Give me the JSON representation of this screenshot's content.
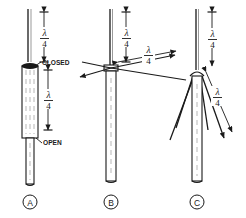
{
  "figure": {
    "name": "quarter-wave-vertical-antenna-variants",
    "background_color": "#ffffff",
    "line_color": "#1a1a1a",
    "width": 246,
    "height": 218
  },
  "symbols": {
    "lambda": "λ",
    "denominator": "4",
    "fraction_label": "λ/4"
  },
  "panels": [
    {
      "id": "A",
      "caption": "A",
      "title": "sleeve-coaxial-dipole",
      "labels": [
        {
          "name": "closed-label",
          "text": "CLOSED"
        },
        {
          "name": "open-label",
          "text": "OPEN"
        }
      ],
      "dimensions": [
        {
          "name": "upper-radiator-length",
          "numerator": "λ",
          "denominator": "4"
        },
        {
          "name": "sleeve-length",
          "numerator": "λ",
          "denominator": "4"
        }
      ]
    },
    {
      "id": "B",
      "caption": "B",
      "title": "ground-plane-horizontal-radials",
      "labels": [],
      "dimensions": [
        {
          "name": "vertical-radiator-length",
          "numerator": "λ",
          "denominator": "4"
        },
        {
          "name": "radial-length",
          "numerator": "λ",
          "denominator": "4"
        }
      ]
    },
    {
      "id": "C",
      "caption": "C",
      "title": "ground-plane-drooping-radials",
      "labels": [],
      "dimensions": [
        {
          "name": "vertical-radiator-length",
          "numerator": "λ",
          "denominator": "4"
        },
        {
          "name": "drooping-radial-length",
          "numerator": "λ",
          "denominator": "4"
        }
      ]
    }
  ]
}
